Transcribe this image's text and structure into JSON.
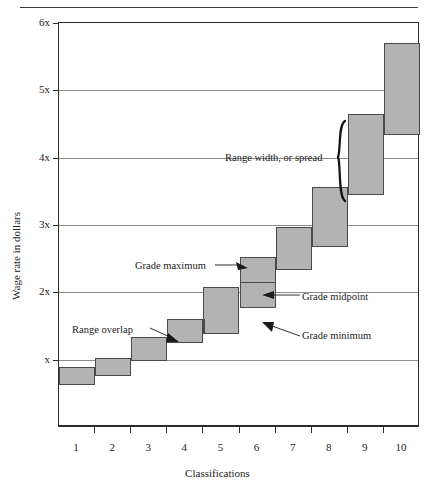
{
  "figure": {
    "y_axis_title": "Wage rate in dollars",
    "x_axis_title": "Classifications"
  },
  "annotations": {
    "range_width": "Range width, or spread",
    "grade_maximum": "Grade maximum",
    "grade_midpoint": "Grade midpoint",
    "range_overlap": "Range overlap",
    "grade_minimum": "Grade minimum"
  },
  "colors": {
    "bar_fill": "#b3b3b3",
    "overlap_fill": "#8e8e8e",
    "bar_stroke": "#4a4a4a",
    "grid": "#8d8d8d",
    "frame": "#2b2b2b"
  },
  "chart_data": {
    "type": "bar",
    "title": "",
    "xlabel": "Classifications",
    "ylabel": "Wage rate in dollars",
    "grid": true,
    "legend": null,
    "xlim": [
      0.5,
      10.5
    ],
    "ylim": [
      0,
      6
    ],
    "ytick_labels": [
      "x",
      "2x",
      "3x",
      "4x",
      "5x",
      "6x"
    ],
    "ytick_values": [
      1,
      2,
      3,
      4,
      5,
      6
    ],
    "xtick_labels": [
      "1",
      "2",
      "3",
      "4",
      "5",
      "6",
      "7",
      "8",
      "9",
      "10"
    ],
    "series": [
      {
        "name": "Grade minimum",
        "values": [
          0.62,
          0.76,
          0.98,
          1.25,
          1.38,
          1.77,
          2.33,
          2.67,
          3.44,
          4.33
        ]
      },
      {
        "name": "Grade maximum",
        "values": [
          0.89,
          1.03,
          1.33,
          1.6,
          2.08,
          2.52,
          2.97,
          3.56,
          4.65,
          5.7
        ]
      },
      {
        "name": "Grade midpoint",
        "values": [
          0.75,
          0.89,
          1.15,
          1.42,
          1.73,
          2.15,
          2.65,
          3.11,
          4.05,
          5.01
        ]
      }
    ],
    "bars": [
      {
        "classification": "1",
        "min": 0.62,
        "max": 0.89,
        "midpoint": 0.75,
        "show_midline": false
      },
      {
        "classification": "2",
        "min": 0.76,
        "max": 1.03,
        "midpoint": 0.89,
        "show_midline": false
      },
      {
        "classification": "3",
        "min": 0.98,
        "max": 1.33,
        "midpoint": 1.15,
        "show_midline": false
      },
      {
        "classification": "4",
        "min": 1.25,
        "max": 1.6,
        "midpoint": 1.42,
        "show_midline": false
      },
      {
        "classification": "5",
        "min": 1.38,
        "max": 2.08,
        "midpoint": 1.73,
        "show_midline": false
      },
      {
        "classification": "6",
        "min": 1.77,
        "max": 2.52,
        "midpoint": 2.15,
        "show_midline": true
      },
      {
        "classification": "7",
        "min": 2.33,
        "max": 2.97,
        "midpoint": 2.65,
        "show_midline": false
      },
      {
        "classification": "8",
        "min": 2.67,
        "max": 3.56,
        "midpoint": 3.11,
        "show_midline": false
      },
      {
        "classification": "9",
        "min": 3.44,
        "max": 4.65,
        "midpoint": 4.05,
        "show_midline": false
      },
      {
        "classification": "10",
        "min": 4.33,
        "max": 5.7,
        "midpoint": 5.01,
        "show_midline": false
      }
    ],
    "overlaps": [
      {
        "between": [
          "4",
          "5"
        ],
        "low": 1.38,
        "high": 1.6
      }
    ]
  }
}
